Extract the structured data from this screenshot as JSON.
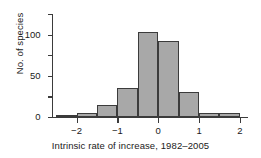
{
  "chart_data": {
    "type": "bar",
    "title": "",
    "subtitle": "",
    "xlabel": "Intrinsic rate of increase, 1982–2005",
    "ylabel": "No. of species",
    "bin_width": 0.5,
    "bin_edges": [
      -2.5,
      -2.0,
      -1.5,
      -1.0,
      -0.5,
      0.0,
      0.5,
      1.0,
      1.5,
      2.0
    ],
    "categories": [
      "-2.5 to -2.0",
      "-2.0 to -1.5",
      "-1.5 to -1.0",
      "-1.0 to -0.5",
      "-0.5 to 0.0",
      "0.0 to 0.5",
      "0.5 to 1.0",
      "1.0 to 1.5",
      "1.5 to 2.0"
    ],
    "values": [
      3,
      5,
      15,
      35,
      103,
      92,
      30,
      5,
      5
    ],
    "xlim": [
      -2.6,
      2.1
    ],
    "ylim": [
      0,
      125
    ],
    "xticks": [
      -2,
      -1,
      0,
      1,
      2
    ],
    "xtick_labels": [
      "−2",
      "−1",
      "0",
      "1",
      "2"
    ],
    "yticks": [
      0,
      25,
      50,
      75,
      100,
      125
    ],
    "ytick_labels": [
      "0",
      "",
      "50",
      "",
      "100",
      ""
    ],
    "ytick_labels_major": [
      {
        "value": 0,
        "label": "0"
      },
      {
        "value": 50,
        "label": "50"
      },
      {
        "value": 100,
        "label": "100"
      }
    ],
    "grid": false,
    "legend": null,
    "bar_fill_color": "#a8a8a8",
    "bar_edge_color": "#3b3b3b",
    "axis_color": "#3b3b3b",
    "background_color": "#ffffff"
  }
}
